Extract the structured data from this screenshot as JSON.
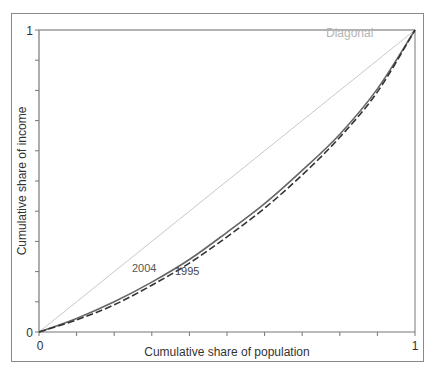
{
  "chart_data": {
    "type": "line",
    "title": "",
    "xlabel": "Cumulative share of population",
    "ylabel": "Cumulative share of income",
    "xlim": [
      0,
      1
    ],
    "ylim": [
      0,
      1
    ],
    "x_tick_labels": [
      "0",
      "1"
    ],
    "y_tick_labels": [
      "0",
      "1"
    ],
    "minor_ticks": 10,
    "grid": false,
    "legend": "inline labels",
    "x": [
      0,
      0.1,
      0.2,
      0.3,
      0.4,
      0.5,
      0.6,
      0.7,
      0.8,
      0.9,
      1.0
    ],
    "series": [
      {
        "name": "Diagonal",
        "style": "solid-light",
        "color": "#c8c8c8",
        "values": [
          0,
          0.1,
          0.2,
          0.3,
          0.4,
          0.5,
          0.6,
          0.7,
          0.8,
          0.9,
          1.0
        ]
      },
      {
        "name": "2004",
        "style": "solid",
        "color": "#666666",
        "values": [
          0,
          0.045,
          0.1,
          0.165,
          0.24,
          0.33,
          0.425,
          0.535,
          0.655,
          0.805,
          1.0
        ]
      },
      {
        "name": "1995",
        "style": "dashed",
        "color": "#333333",
        "values": [
          0,
          0.04,
          0.09,
          0.155,
          0.228,
          0.315,
          0.41,
          0.52,
          0.645,
          0.795,
          1.0
        ]
      }
    ],
    "annotations": [
      {
        "text": "Diagonal",
        "x": 0.84,
        "y": 0.96
      },
      {
        "text": "2004",
        "x": 0.27,
        "y": 0.21
      },
      {
        "text": "1995",
        "x": 0.36,
        "y": 0.205
      }
    ]
  },
  "labels": {
    "x_axis": "Cumulative share of population",
    "y_axis": "Cumulative share of income",
    "x_min": "0",
    "x_max": "1",
    "y_min": "0",
    "y_max": "1",
    "diagonal": "Diagonal",
    "series_2004": "2004",
    "series_1995": "1995"
  }
}
